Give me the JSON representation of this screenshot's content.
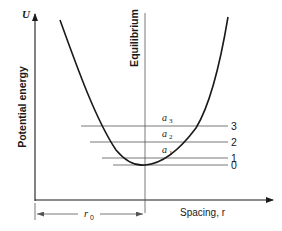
{
  "diagram": {
    "y_axis": {
      "symbol": "U",
      "label": "Potential energy"
    },
    "x_axis": {
      "label": "Spacing, r"
    },
    "equilibrium_line": {
      "label": "Equilibrium"
    },
    "dimension": {
      "label": "r",
      "subscript": "0"
    },
    "levels": [
      {
        "number": "0",
        "amplitude_label": "",
        "amplitude_sub": ""
      },
      {
        "number": "1",
        "amplitude_label": "a",
        "amplitude_sub": "1"
      },
      {
        "number": "2",
        "amplitude_label": "a",
        "amplitude_sub": "2"
      },
      {
        "number": "3",
        "amplitude_label": "a",
        "amplitude_sub": "3"
      }
    ],
    "colors": {
      "line": "#1a1a1a",
      "thin_line": "#555555",
      "background": "#ffffff"
    }
  }
}
